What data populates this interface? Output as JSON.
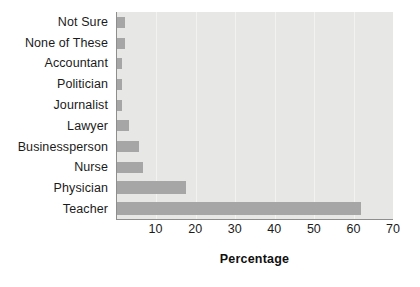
{
  "chart_data": {
    "type": "bar",
    "orientation": "horizontal",
    "title": "",
    "xlabel": "Percentage",
    "ylabel": "",
    "xlim": [
      0,
      70
    ],
    "xticks": [
      10,
      20,
      30,
      40,
      50,
      60,
      70
    ],
    "grid": true,
    "legend": false,
    "bar_color": "#a6a6a6",
    "plot_background": "#e7e7e5",
    "gridline_color": "#f2f2f0",
    "axis_color": "#8e8e8e",
    "categories": [
      "Not Sure",
      "None of These",
      "Accountant",
      "Politician",
      "Journalist",
      "Lawyer",
      "Businessperson",
      "Nurse",
      "Physician",
      "Teacher"
    ],
    "values": [
      2,
      2,
      1.2,
      1.2,
      1.2,
      3,
      5.6,
      6.5,
      17.5,
      62
    ]
  }
}
